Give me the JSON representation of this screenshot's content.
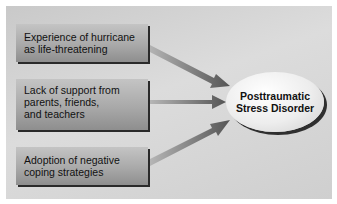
{
  "diagram": {
    "causes": [
      {
        "lines": [
          "Experience of hurricane",
          "as life-threatening"
        ]
      },
      {
        "lines": [
          "Lack of support from",
          "parents, friends,",
          "and teachers"
        ]
      },
      {
        "lines": [
          "Adoption of negative",
          "coping strategies"
        ]
      }
    ],
    "outcome": {
      "lines": [
        "Posttraumatic",
        "Stress Disorder"
      ]
    },
    "colors": {
      "background": "#d4d4d4",
      "box": "#a9a9a9",
      "arrow": "#6a6a6a",
      "ellipse": "#f2f2f2"
    }
  }
}
